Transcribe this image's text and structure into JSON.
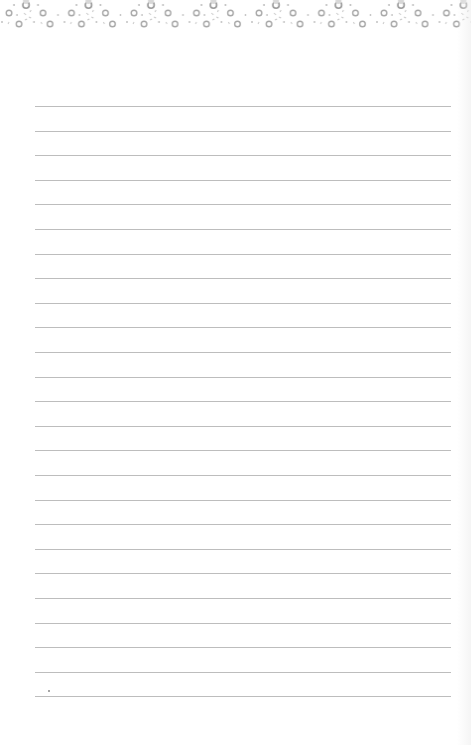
{
  "page": {
    "type": "lined-notepad-paper",
    "background_color": "#ffffff",
    "line_color": "#bdbdbd",
    "line_count": 25,
    "line_start_y": 106,
    "line_spacing": 24.6,
    "line_left_x": 35,
    "line_right_x": 451
  },
  "decoration": {
    "style": "rings-and-sparkles-top-border",
    "ring_color": "#a8a8a8",
    "sparkle_color": "#c4c4c4",
    "eyelet_color": "#9a9a9a"
  }
}
